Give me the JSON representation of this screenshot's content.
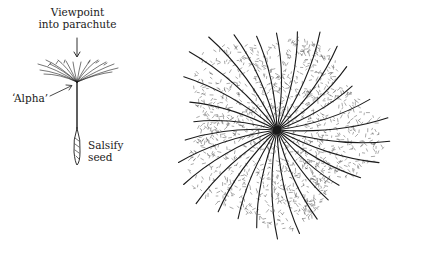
{
  "figure": {
    "labels": {
      "viewpoint_line1": "Viewpoint",
      "viewpoint_line2": "into parachute",
      "alpha": "‘Alpha’",
      "seed_line1": "Salsify",
      "seed_line2": "seed"
    },
    "left_drawing": "salsify seed with parachute pappus, side view",
    "right_drawing": "parachute pappus viewed from above, radiating bristles with fine hairs",
    "colors": {
      "ink": "#1a1a1a",
      "background": "#ffffff"
    }
  }
}
